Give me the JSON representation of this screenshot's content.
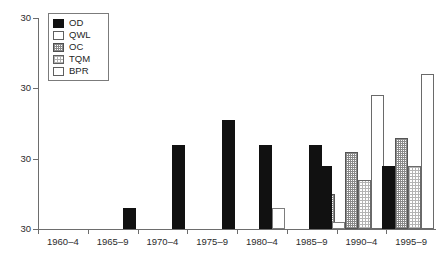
{
  "chart_data": {
    "type": "bar",
    "title": "",
    "subtitle": "",
    "xlabel": "",
    "ylabel": "",
    "grid": false,
    "legend_position": "top-left",
    "categories": [
      "1960–4",
      "1965–9",
      "1970–4",
      "1975–9",
      "1980–4",
      "1985–9",
      "1990–4",
      "1995–9"
    ],
    "ylim": [
      0,
      30
    ],
    "ytick_labels": [
      "30",
      "30",
      "30",
      "30"
    ],
    "ytick_values": [
      30,
      20,
      10,
      0
    ],
    "series": [
      {
        "name": "OD",
        "values": [
          0,
          3,
          12,
          15.5,
          12,
          12,
          9,
          9
        ]
      },
      {
        "name": "QWL",
        "values": [
          0,
          0,
          0,
          0,
          3,
          0,
          1,
          0
        ]
      },
      {
        "name": "OC",
        "values": [
          0,
          0,
          0,
          0,
          0,
          5,
          11,
          13
        ]
      },
      {
        "name": "TQM",
        "values": [
          0,
          0,
          0,
          0,
          0,
          0,
          7,
          9
        ]
      },
      {
        "name": "BPR",
        "values": [
          0,
          0,
          0,
          0,
          0,
          0,
          19,
          22
        ]
      }
    ]
  },
  "legend": {
    "items": [
      {
        "label": "OD",
        "style": "od",
        "swatch_color": "#111111"
      },
      {
        "label": "QWL",
        "style": "qwl",
        "swatch_color": "#ffffff"
      },
      {
        "label": "OC",
        "style": "oc",
        "swatch_color": "#c8c8c8"
      },
      {
        "label": "TQM",
        "style": "tqm",
        "swatch_color": "#e2e2e2"
      },
      {
        "label": "BPR",
        "style": "bpr",
        "swatch_color": "#ffffff"
      }
    ]
  },
  "axis": {
    "line_color": "#6d6d6d",
    "text_color": "#2b2b2b"
  }
}
